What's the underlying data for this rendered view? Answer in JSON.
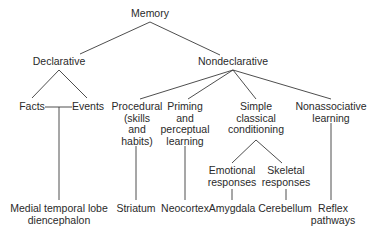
{
  "diagram": {
    "root": "Memory",
    "level1": {
      "declarative": "Declarative",
      "nondeclarative": "Nondeclarative"
    },
    "declarative_children": {
      "facts": "Facts",
      "events": "Events",
      "structure": [
        "Medial temporal lobe",
        "diencephalon"
      ]
    },
    "nondeclarative_children": {
      "procedural": [
        "Procedural",
        "(skills",
        "and",
        "habits)"
      ],
      "priming": [
        "Priming",
        "and",
        "perceptual",
        "learning"
      ],
      "classical": [
        "Simple",
        "classical",
        "conditioning"
      ],
      "nonassociative": [
        "Nonassociative",
        "learning"
      ]
    },
    "conditioning_children": {
      "emotional": [
        "Emotional",
        "responses"
      ],
      "skeletal": [
        "Skeletal",
        "responses"
      ]
    },
    "structures": {
      "procedural": "Striatum",
      "priming": "Neocortex",
      "emotional": "Amygdala",
      "skeletal": "Cerebellum",
      "nonassociative": [
        "Reflex",
        "pathways"
      ]
    }
  }
}
